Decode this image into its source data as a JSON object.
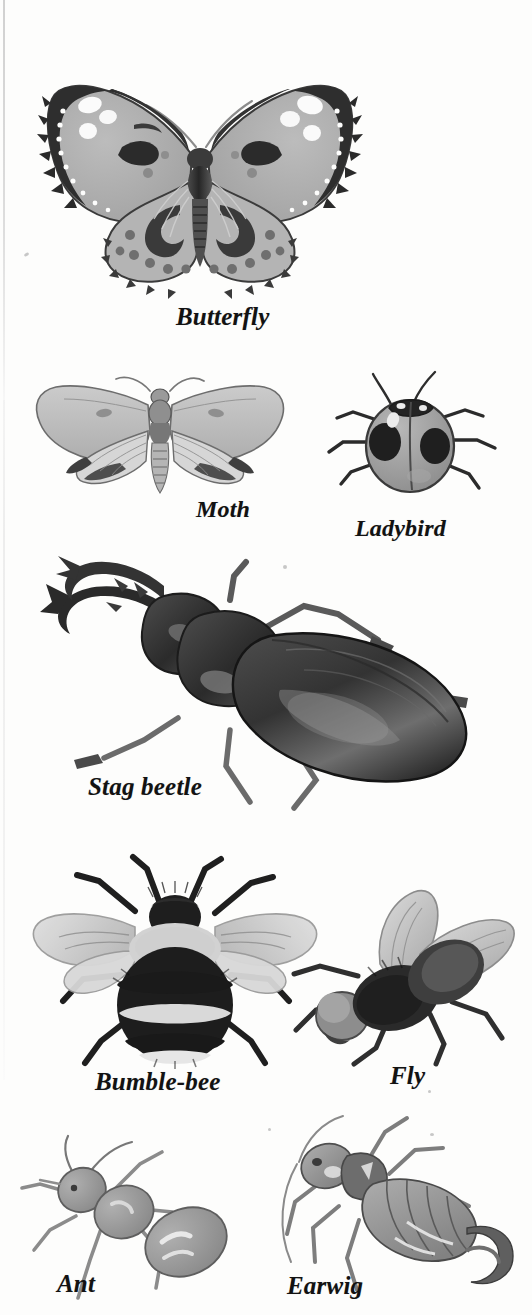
{
  "page": {
    "kind": "book-plate",
    "background_color": "#fdfdfc",
    "ink_color": "#121212",
    "mid_tone": "#9a9a9a",
    "light_tone": "#cfcfcf",
    "width": 532,
    "height": 1315
  },
  "figures": [
    {
      "id": "butterfly",
      "label": "Butterfly",
      "icon": "butterfly-illustration",
      "label_x": 176,
      "label_y": 303,
      "label_size": 25
    },
    {
      "id": "moth",
      "label": "Moth",
      "icon": "moth-illustration",
      "label_x": 196,
      "label_y": 496,
      "label_size": 24
    },
    {
      "id": "ladybird",
      "label": "Ladybird",
      "icon": "ladybird-illustration",
      "label_x": 355,
      "label_y": 515,
      "label_size": 24
    },
    {
      "id": "stag-beetle",
      "label": "Stag beetle",
      "icon": "stag-beetle-illustration",
      "label_x": 88,
      "label_y": 773,
      "label_size": 25
    },
    {
      "id": "bumble-bee",
      "label": "Bumble-bee",
      "icon": "bumble-bee-illustration",
      "label_x": 95,
      "label_y": 1068,
      "label_size": 25
    },
    {
      "id": "fly",
      "label": "Fly",
      "icon": "fly-illustration",
      "label_x": 390,
      "label_y": 1062,
      "label_size": 25
    },
    {
      "id": "ant",
      "label": "Ant",
      "icon": "ant-illustration",
      "label_x": 57,
      "label_y": 1270,
      "label_size": 25
    },
    {
      "id": "earwig",
      "label": "Earwig",
      "icon": "earwig-illustration",
      "label_x": 287,
      "label_y": 1272,
      "label_size": 25
    }
  ]
}
